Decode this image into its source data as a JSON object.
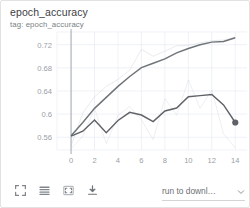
{
  "card": {
    "title": "epoch_accuracy",
    "subtitle": "tag: epoch_accuracy"
  },
  "toolbar": {
    "buttons": [
      {
        "name": "expand-icon",
        "label": "fullscreen"
      },
      {
        "name": "data-table-icon",
        "label": "data table"
      },
      {
        "name": "fit-domain-icon",
        "label": "fit domain to data"
      },
      {
        "name": "download-icon",
        "label": "download"
      }
    ],
    "run_select": {
      "value": "run to downl…",
      "caret": "chevron-down-icon"
    }
  },
  "colors": {
    "train": "#6f7479",
    "validation": "#5f6368",
    "train_raw": "#b9bec4",
    "validation_raw": "#c6cbd1",
    "grid": "#e7ecf3",
    "axis": "#9aa0a6",
    "tick_text": "#9aa0a6",
    "title_text": "#3c4043",
    "subtitle_text": "#7a7f85"
  },
  "chart_data": {
    "type": "line",
    "title": "epoch_accuracy",
    "subtitle": "tag: epoch_accuracy",
    "xlabel": "",
    "ylabel": "",
    "xlim": [
      -1.2,
      15.0
    ],
    "ylim": [
      0.538,
      0.742
    ],
    "xticks": [
      0,
      2,
      4,
      6,
      8,
      10,
      12,
      14
    ],
    "yticks": [
      0.56,
      0.6,
      0.64,
      0.68,
      0.72
    ],
    "ytick_labels": [
      "0.56",
      "0.6",
      "0.64",
      "0.68",
      "0.72"
    ],
    "xtick_labels": [
      "0",
      "2",
      "4",
      "6",
      "8",
      "10",
      "12",
      "14"
    ],
    "grid": true,
    "legend": false,
    "vertical_axis_at_x": 0,
    "series": [
      {
        "name": "train (smoothed)",
        "kind": "smoothed",
        "color": "#6f7479",
        "x": [
          0,
          1,
          2,
          3,
          4,
          5,
          6,
          7,
          8,
          9,
          10,
          11,
          12,
          13,
          14
        ],
        "values": [
          0.5625,
          0.5855,
          0.61,
          0.629,
          0.648,
          0.665,
          0.6805,
          0.688,
          0.6955,
          0.706,
          0.7135,
          0.72,
          0.7245,
          0.7255,
          0.732
        ]
      },
      {
        "name": "train (raw)",
        "kind": "raw",
        "color": "#b9bec4",
        "x": [
          0,
          1,
          2,
          3,
          4,
          5,
          6,
          7,
          8,
          9,
          10,
          11,
          12,
          13,
          14
        ],
        "values": [
          0.545,
          0.602,
          0.63,
          0.648,
          0.66,
          0.676,
          0.712,
          0.7,
          0.709,
          0.718,
          0.719,
          0.723,
          0.727,
          0.728,
          0.733
        ]
      },
      {
        "name": "validation (smoothed)",
        "kind": "smoothed",
        "color": "#5f6368",
        "x": [
          0,
          1,
          2,
          3,
          4,
          5,
          6,
          7,
          8,
          9,
          10,
          11,
          12,
          13,
          14
        ],
        "values": [
          0.562,
          0.5705,
          0.59,
          0.568,
          0.589,
          0.603,
          0.5985,
          0.587,
          0.6055,
          0.6105,
          0.63,
          0.632,
          0.634,
          0.616,
          0.5855
        ]
      },
      {
        "name": "validation (raw)",
        "kind": "raw",
        "color": "#c6cbd1",
        "x": [
          0,
          1,
          2,
          3,
          4,
          5,
          6,
          7,
          8,
          9,
          10,
          11,
          12,
          13,
          14
        ],
        "values": [
          0.54,
          0.562,
          0.61,
          0.549,
          0.598,
          0.613,
          0.59,
          0.556,
          0.627,
          0.598,
          0.659,
          0.61,
          0.642,
          0.566,
          0.542
        ]
      }
    ],
    "endpoint_marker": {
      "series": "validation (smoothed)",
      "x": 14,
      "y": 0.5855,
      "color": "#5f6368",
      "radius": 3.1
    }
  }
}
